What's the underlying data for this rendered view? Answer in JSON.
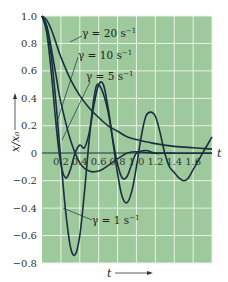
{
  "chart_data": {
    "type": "line",
    "title": "",
    "xlabel": "t",
    "ylabel": "x/x0",
    "xlim": [
      0,
      1.8
    ],
    "ylim": [
      -0.8,
      1.0
    ],
    "grid": true,
    "background_color": "#9ec99c",
    "grid_color": "#e8f3e6",
    "line_color": "#1b2f3f",
    "x_ticks": [
      "0.2",
      "0.4",
      "0.6",
      "0.8",
      "1.0",
      "1.2",
      "1.4",
      "1.6"
    ],
    "x_tick_values": [
      0.2,
      0.4,
      0.6,
      0.8,
      1.0,
      1.2,
      1.4,
      1.6
    ],
    "y_ticks": [
      "1.0",
      "0.8",
      "0.6",
      "0.4",
      "0.2",
      "0",
      "−0.2",
      "−0.4",
      "−0.6",
      "−0.8"
    ],
    "y_tick_values": [
      1.0,
      0.8,
      0.6,
      0.4,
      0.2,
      0,
      -0.2,
      -0.4,
      -0.6,
      -0.8
    ],
    "axis_end_label": "t",
    "bottom_arrow_label": "t",
    "series": [
      {
        "name": "γ = 20 s⁻¹",
        "label_text": "γ = 20 s",
        "label_sup": "−1",
        "x": [
          0,
          0.05,
          0.1,
          0.15,
          0.2,
          0.3,
          0.4,
          0.5,
          0.6,
          0.7,
          0.8,
          0.9,
          1.0,
          1.2,
          1.4,
          1.6,
          1.8
        ],
        "y": [
          1.0,
          0.97,
          0.9,
          0.8,
          0.7,
          0.54,
          0.42,
          0.33,
          0.26,
          0.2,
          0.16,
          0.12,
          0.1,
          0.07,
          0.05,
          0.04,
          0.03
        ]
      },
      {
        "name": "γ = 10 s⁻¹",
        "label_text": "γ = 10 s",
        "label_sup": "−1",
        "x": [
          0,
          0.05,
          0.1,
          0.15,
          0.2,
          0.3,
          0.4,
          0.5,
          0.6,
          0.7,
          0.8,
          0.9,
          1.0,
          1.2,
          1.4,
          1.6,
          1.8
        ],
        "y": [
          1.0,
          0.93,
          0.76,
          0.56,
          0.37,
          0.1,
          -0.07,
          -0.13,
          -0.13,
          -0.09,
          -0.04,
          0.0,
          0.01,
          0.0,
          0.0,
          0.0,
          0.0
        ]
      },
      {
        "name": "γ = 5 s⁻¹",
        "label_text": "γ = 5 s",
        "label_sup": "−1",
        "x": [
          0,
          0.05,
          0.1,
          0.15,
          0.2,
          0.25,
          0.3,
          0.35,
          0.4,
          0.45,
          0.5,
          0.55,
          0.6,
          0.65,
          0.7,
          0.75,
          0.8,
          0.85,
          0.9,
          0.95,
          1.0,
          1.1,
          1.2,
          1.3,
          1.4
        ],
        "y": [
          1.0,
          0.88,
          0.58,
          0.2,
          -0.08,
          -0.18,
          -0.12,
          0.0,
          0.06,
          0.04,
          0.15,
          0.35,
          0.5,
          0.5,
          0.33,
          0.1,
          -0.08,
          -0.18,
          -0.17,
          -0.08,
          0.0,
          0.02,
          0.0,
          0.0,
          0.0
        ]
      },
      {
        "name": "γ = 1 s⁻¹",
        "label_text": "γ = 1 s",
        "label_sup": "−1",
        "x": [
          0,
          0.05,
          0.1,
          0.15,
          0.2,
          0.25,
          0.3,
          0.35,
          0.4,
          0.45,
          0.5,
          0.55,
          0.6,
          0.7,
          0.8,
          0.85,
          0.9,
          0.95,
          1.0,
          1.05,
          1.1,
          1.15,
          1.2,
          1.25,
          1.3,
          1.35,
          1.4,
          1.45,
          1.5,
          1.55,
          1.6,
          1.65,
          1.7,
          1.75,
          1.8
        ],
        "y": [
          1.0,
          0.92,
          0.7,
          0.35,
          -0.05,
          -0.42,
          -0.68,
          -0.74,
          -0.6,
          -0.28,
          0.1,
          0.4,
          0.5,
          0.3,
          -0.15,
          -0.32,
          -0.36,
          -0.28,
          -0.1,
          0.12,
          0.27,
          0.3,
          0.27,
          0.15,
          0.0,
          -0.1,
          -0.14,
          -0.18,
          -0.2,
          -0.18,
          -0.12,
          -0.06,
          0.0,
          0.06,
          0.12
        ]
      }
    ]
  },
  "labels": {
    "gamma20": {
      "text": "γ = 20 s",
      "sup": "−1"
    },
    "gamma10": {
      "text": "γ = 10 s",
      "sup": "−1"
    },
    "gamma5": {
      "text": "γ = 5 s",
      "sup": "−1"
    },
    "gamma1": {
      "text": "γ = 1 s",
      "sup": "−1"
    },
    "y_axis_label": "x/x₀",
    "x_axis_end": "t",
    "x_arrow_label": "t"
  }
}
